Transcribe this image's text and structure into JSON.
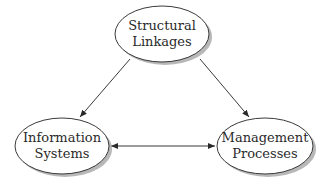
{
  "diagram": {
    "nodes": [
      {
        "id": "structural",
        "line1": "Structural",
        "line2": "Linkages"
      },
      {
        "id": "information",
        "line1": "Information",
        "line2": "Systems"
      },
      {
        "id": "management",
        "line1": "Management",
        "line2": "Processes"
      }
    ],
    "edges": [
      {
        "from": "structural",
        "to": "information",
        "type": "directed"
      },
      {
        "from": "structural",
        "to": "management",
        "type": "directed"
      },
      {
        "from": "information",
        "to": "management",
        "type": "bidirectional"
      }
    ],
    "colors": {
      "stroke": "#3a3a3a",
      "fill": "#ffffff",
      "shadow": "#9a9a9a",
      "text": "#2a2a2a"
    }
  }
}
